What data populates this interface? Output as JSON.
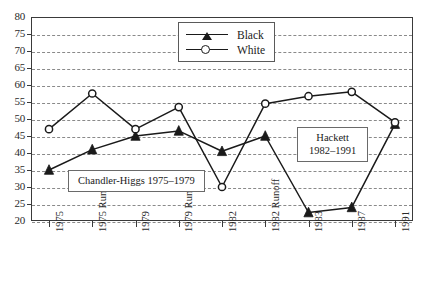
{
  "chart_data": {
    "type": "line",
    "title": "",
    "xlabel": "",
    "ylabel": "",
    "ylim": [
      20,
      80
    ],
    "ytick_step": 5,
    "yticks": [
      80,
      75,
      70,
      65,
      60,
      55,
      50,
      45,
      40,
      35,
      30,
      25,
      20
    ],
    "grid": true,
    "legend_position": "top-center",
    "categories": [
      "1975",
      "1975 Runoff",
      "1979",
      "1979 Runoff",
      "1982",
      "1982 Runoff",
      "1983",
      "1987",
      "1991"
    ],
    "series": [
      {
        "name": "Black",
        "marker": "filled-triangle",
        "color": "#1a1a1a",
        "values": [
          35,
          41,
          45,
          46.5,
          40.5,
          45,
          22.5,
          24,
          48.5
        ]
      },
      {
        "name": "White",
        "marker": "open-circle",
        "color": "#1a1a1a",
        "values": [
          47,
          57.5,
          47,
          53.5,
          30,
          54.5,
          56.7,
          58,
          49
        ]
      }
    ],
    "annotations": [
      {
        "id": "chandler-higgs",
        "lines": [
          "Chandler-Higgs 1975–1979"
        ]
      },
      {
        "id": "hackett",
        "lines": [
          "Hackett",
          "1982–1991"
        ]
      }
    ]
  },
  "legend": {
    "entries": [
      {
        "label": "Black"
      },
      {
        "label": "White"
      }
    ]
  },
  "annotations": {
    "chandler": {
      "line1": "Chandler-Higgs 1975–1979"
    },
    "hackett": {
      "line1": "Hackett",
      "line2": "1982–1991"
    }
  }
}
